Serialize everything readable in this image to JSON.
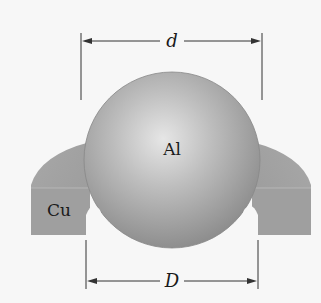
{
  "figure": {
    "ball": {
      "material_label": "Al",
      "color": "#a9a9a9"
    },
    "ring": {
      "material_label": "Cu",
      "color": "#9c9c9c"
    },
    "dimensions": {
      "ball_diameter_label": "d",
      "ring_inner_diameter_label": "D"
    },
    "background_color": "#f7f7f7"
  }
}
